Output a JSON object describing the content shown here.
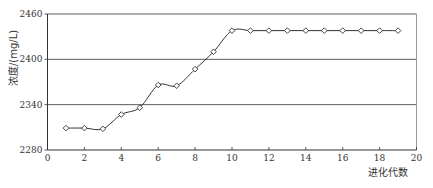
{
  "chart_data": {
    "type": "line",
    "title": "",
    "xlabel": "进化代数",
    "ylabel": "浓度/(mg/L)",
    "xlim": [
      0,
      20
    ],
    "ylim": [
      2280,
      2460
    ],
    "xticks": [
      0,
      2,
      4,
      6,
      8,
      10,
      12,
      14,
      16,
      18,
      20
    ],
    "yticks": [
      2280,
      2340,
      2400,
      2460
    ],
    "grid": "horizontal",
    "legend": null,
    "smooth": true,
    "marker": "diamond",
    "series": [
      {
        "name": "浓度",
        "x": [
          1,
          2,
          3,
          4,
          5,
          6,
          7,
          8,
          9,
          10,
          11,
          12,
          13,
          14,
          15,
          16,
          17,
          18,
          19
        ],
        "values": [
          2309,
          2309,
          2308,
          2327,
          2336,
          2366,
          2365,
          2387,
          2410,
          2438,
          2438,
          2438,
          2438,
          2438,
          2438,
          2438,
          2438,
          2438,
          2438
        ]
      }
    ]
  },
  "colors": {
    "line": "#333333",
    "grid": "#5a5a5a",
    "axis": "#333333",
    "border": "#9a9a9a",
    "marker_fill": "#ffffff"
  }
}
